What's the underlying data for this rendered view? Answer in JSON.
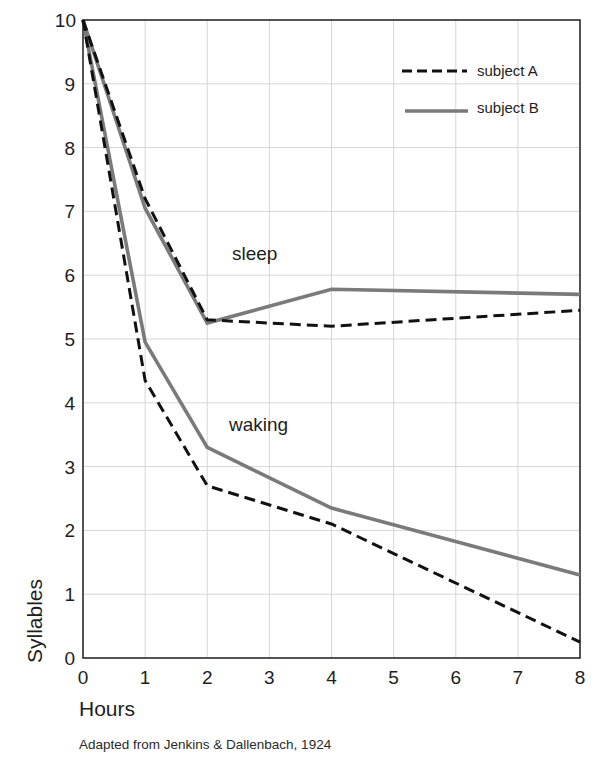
{
  "chart_data": {
    "type": "line",
    "title": "",
    "xlabel": "Hours",
    "ylabel": "Syllables",
    "xlim": [
      0,
      8
    ],
    "ylim": [
      0,
      10
    ],
    "grid": true,
    "legend_position": "top-right",
    "x_ticks": [
      0,
      1,
      2,
      3,
      4,
      5,
      6,
      7,
      8
    ],
    "y_ticks": [
      0,
      1,
      2,
      3,
      4,
      5,
      6,
      7,
      8,
      9,
      10
    ],
    "legend": [
      {
        "label": "subject A",
        "style": "dashed",
        "color": "#111111"
      },
      {
        "label": "subject B",
        "style": "solid",
        "color": "#7a7a7a"
      }
    ],
    "annotations": [
      {
        "text": "sleep",
        "x": 2.8,
        "y": 6.2
      },
      {
        "text": "waking",
        "x": 2.8,
        "y": 3.6
      }
    ],
    "x": [
      0,
      1,
      2,
      4,
      8
    ],
    "series": [
      {
        "name": "subject A (sleep)",
        "subject": "subject A",
        "condition": "sleep",
        "values": [
          10,
          7.2,
          5.3,
          5.2,
          5.45
        ]
      },
      {
        "name": "subject B (sleep)",
        "subject": "subject B",
        "condition": "sleep",
        "values": [
          10,
          7.05,
          5.25,
          5.78,
          5.7
        ]
      },
      {
        "name": "subject A (waking)",
        "subject": "subject A",
        "condition": "waking",
        "values": [
          10,
          4.35,
          2.7,
          2.1,
          0.25
        ]
      },
      {
        "name": "subject B (waking)",
        "subject": "subject B",
        "condition": "waking",
        "values": [
          10,
          4.95,
          3.3,
          2.35,
          1.3
        ]
      }
    ],
    "caption": "Adapted from Jenkins & Dallenbach, 1924"
  },
  "labels": {
    "xlabel": "Hours",
    "ylabel": "Syllables",
    "legend_a": "subject A",
    "legend_b": "subject B",
    "sleep": "sleep",
    "waking": "waking",
    "caption": "Adapted from Jenkins & Dallenbach, 1924"
  },
  "colors": {
    "subject_a": "#111111",
    "subject_b": "#7a7a7a",
    "grid": "#d6d6d6",
    "axis": "#2a2a2a"
  }
}
